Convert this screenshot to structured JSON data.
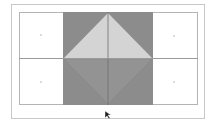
{
  "diagram": {
    "colors": {
      "background": "#ffffff",
      "frame_border": "#c8c8c8",
      "grid_border": "#b4b4b4",
      "dark_fill": "#8c8c8c",
      "light_triangle": "#d4d4d4",
      "lower_triangle": "#939393",
      "center_line": "#6e6e6e",
      "dot": "#cfcfcf"
    },
    "cells": {
      "left_top": {
        "marker": "dot"
      },
      "left_bottom": {
        "marker": "dot"
      },
      "right_top": {
        "marker": "dot"
      },
      "right_bottom": {
        "marker": "dot"
      }
    },
    "center_block": {
      "top_shape": "triangle-apex-up",
      "bottom_shape": "triangle-apex-down",
      "vertical_divider": true
    },
    "cursor": {
      "icon": "mouse-pointer-icon"
    }
  }
}
